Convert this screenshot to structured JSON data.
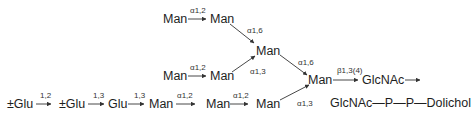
{
  "nodes": {
    "top_man1": "Man",
    "top_man2": "Man",
    "mid_man": "Man",
    "row2_man1": "Man",
    "row2_man2": "Man",
    "branch_man": "Man",
    "glcnac1": "GlcNAc",
    "chain_end": "GlcNAc—P—P—Dolichol",
    "glu1": "±Glu",
    "glu2": "±Glu",
    "glu3": "Glu",
    "bot_man1": "Man",
    "bot_man2": "Man",
    "bot_man3": "Man"
  },
  "linkages": {
    "top_a12": "α1,2",
    "top_a16": "α1,6",
    "row2_a12": "α1,2",
    "row2_a13": "α1,3",
    "mid_a16": "α1,6",
    "branch_b134": "β1,3(4)",
    "glu_12": "1,2",
    "glu_13a": "1,3",
    "glu_13b": "1,3",
    "bot_a12a": "α1,2",
    "bot_a12b": "α1,2",
    "bot_a13": "α1,3"
  },
  "colors": {
    "text": "#1e1e1e",
    "line": "#333333",
    "background": "#ffffff"
  }
}
